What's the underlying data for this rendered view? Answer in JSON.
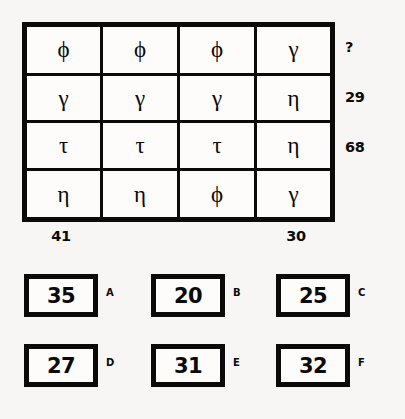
{
  "puzzle": {
    "type": "symbol-matrix-sum-puzzle",
    "matrix": {
      "rows": 4,
      "cols": 4,
      "cells": [
        [
          "ϕ",
          "ϕ",
          "ϕ",
          "γ"
        ],
        [
          "γ",
          "γ",
          "γ",
          "η"
        ],
        [
          "τ",
          "τ",
          "τ",
          "η"
        ],
        [
          "η",
          "η",
          "ϕ",
          "γ"
        ]
      ],
      "symbol_names": [
        "phi",
        "gamma",
        "tau",
        "eta"
      ]
    },
    "row_sums": [
      "?",
      "29",
      "68",
      ""
    ],
    "col_sums": [
      "41",
      "",
      "",
      "30"
    ],
    "unknown_marker": "?",
    "options": [
      {
        "letter": "A",
        "value": "35"
      },
      {
        "letter": "B",
        "value": "20"
      },
      {
        "letter": "C",
        "value": "25"
      },
      {
        "letter": "D",
        "value": "27"
      },
      {
        "letter": "E",
        "value": "31"
      },
      {
        "letter": "F",
        "value": "32"
      }
    ]
  },
  "colors": {
    "ink": "#0a0a0a",
    "page_background": "#f7f6f4",
    "cell_background": "#fdfcfb"
  }
}
